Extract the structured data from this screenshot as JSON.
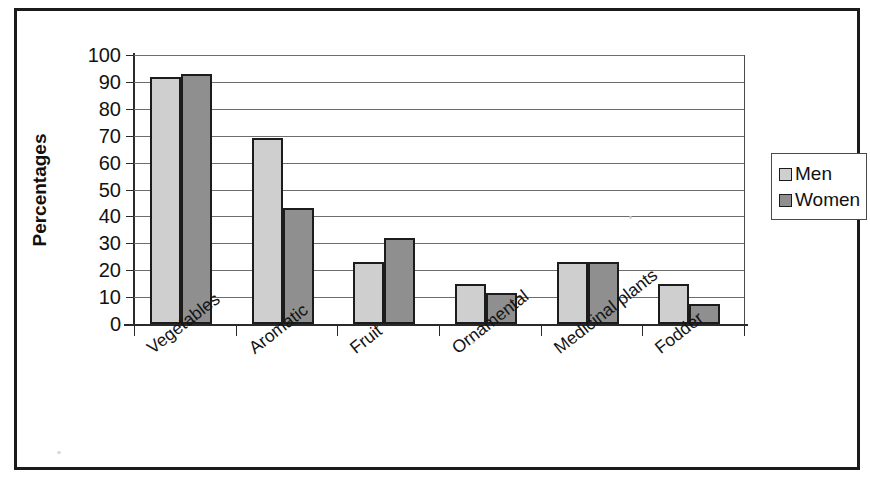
{
  "chart_data": {
    "type": "bar",
    "title": "",
    "xlabel": "",
    "ylabel": "Percentages",
    "ylim": [
      0,
      100
    ],
    "ytick_step": 10,
    "yticks": [
      100,
      90,
      80,
      70,
      60,
      50,
      40,
      30,
      20,
      10,
      0
    ],
    "grid": true,
    "legend_position": "right",
    "categories": [
      "Vegetables",
      "Aromatic",
      "Fruit",
      "Ornamental",
      "Medicinal plants",
      "Fodder"
    ],
    "series": [
      {
        "name": "Men",
        "color": "#cfcfcf",
        "values": [
          92,
          69,
          23,
          15,
          23,
          15
        ]
      },
      {
        "name": "Women",
        "color": "#8f8f8f",
        "values": [
          93,
          43,
          32,
          11.5,
          23,
          7.5
        ]
      }
    ]
  },
  "legend": {
    "items": [
      {
        "label": "Men",
        "swatch": "men"
      },
      {
        "label": "Women",
        "swatch": "women"
      }
    ]
  },
  "axes": {
    "y_title": "Percentages"
  }
}
